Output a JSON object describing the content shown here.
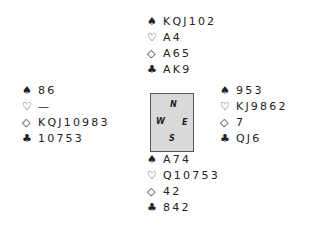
{
  "suits": {
    "spades": "♠",
    "hearts": "♡",
    "diamonds": "◇",
    "clubs": "♣"
  },
  "compass": {
    "north": "N",
    "west": "W",
    "east": "E",
    "south": "S"
  },
  "hands": {
    "north": {
      "spades": "KQJ102",
      "hearts": "A4",
      "diamonds": "A65",
      "clubs": "AK9"
    },
    "west": {
      "spades": "86",
      "hearts": "—",
      "diamonds": "KQJ10983",
      "clubs": "10753"
    },
    "east": {
      "spades": "953",
      "hearts": "KJ9862",
      "diamonds": "7",
      "clubs": "QJ6"
    },
    "south": {
      "spades": "A74",
      "hearts": "Q10753",
      "diamonds": "42",
      "clubs": "842"
    }
  }
}
